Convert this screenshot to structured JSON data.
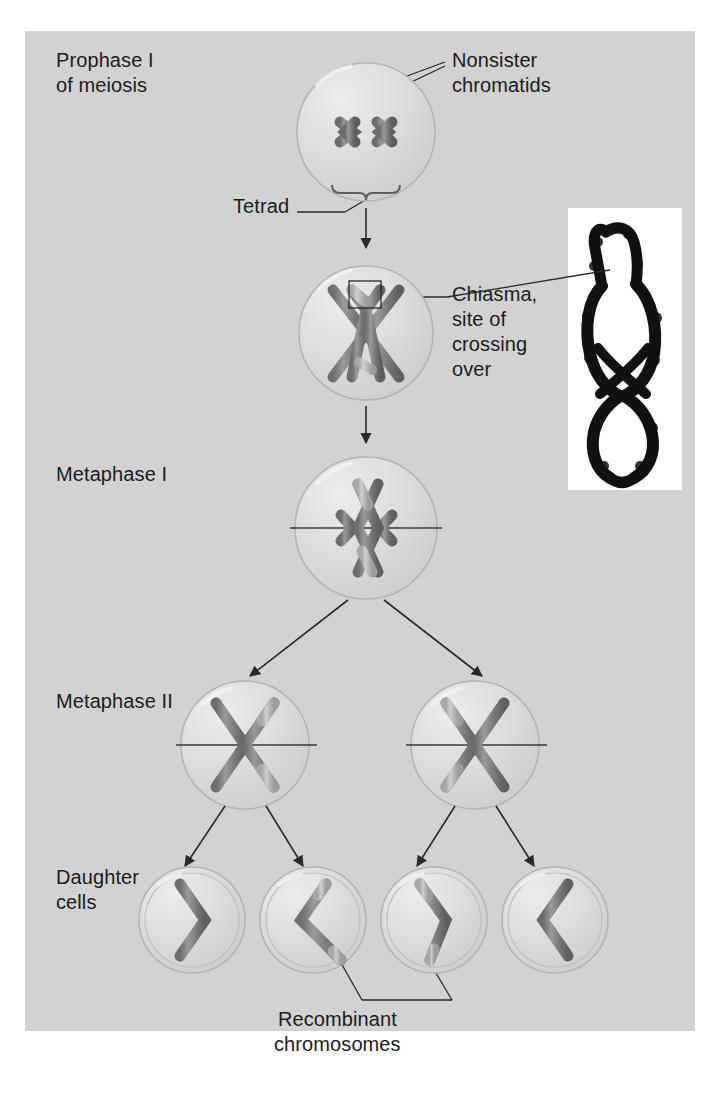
{
  "figure": {
    "background_color": "#d2d2d2",
    "chromosome_color": "#7b7b7b",
    "chromosome_light_color": "#b9b9b9",
    "cell_color": "#d9d9d9",
    "line_color": "#2a2a2a"
  },
  "stage_labels": {
    "prophase": "Prophase I\nof meiosis",
    "metaphase_1": "Metaphase I",
    "metaphase_2": "Metaphase II",
    "daughter": "Daughter\ncells"
  },
  "callouts": {
    "nonsister": "Nonsister\nchromatids",
    "tetrad": "Tetrad",
    "chiasma": "Chiasma,\nsite of\ncrossing\nover",
    "recombinant": "Recombinant\nchromosomes"
  },
  "inset": {
    "name": "chiasma-micrograph",
    "description": "Light micrograph of a tetrad showing a chiasma"
  },
  "stages": [
    {
      "id": "prophase-1",
      "label": "Prophase I of meiosis",
      "cell_count": 1,
      "chromatids": 4,
      "note": "tetrad of four aligned chromatids"
    },
    {
      "id": "crossing-over",
      "label": "Crossing over",
      "cell_count": 1,
      "chromatids": 4,
      "note": "chiasma forms between nonsister chromatids"
    },
    {
      "id": "metaphase-1",
      "label": "Metaphase I",
      "cell_count": 1,
      "chromatids": 4,
      "note": "tetrad aligned on metaphase plate"
    },
    {
      "id": "metaphase-2",
      "label": "Metaphase II",
      "cell_count": 2,
      "chromatids": 2,
      "note": "each cell has one recombinant chromosome"
    },
    {
      "id": "daughter-cells",
      "label": "Daughter cells",
      "cell_count": 4,
      "chromatids": 1,
      "note": "two parental and two recombinant chromosomes"
    }
  ]
}
